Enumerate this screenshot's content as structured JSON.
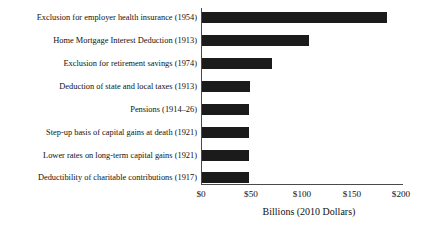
{
  "chart_data": {
    "type": "bar",
    "orientation": "horizontal",
    "title": "",
    "subtitle": "",
    "xlabel": "Billions (2010 Dollars)",
    "ylabel": "",
    "xlim": [
      0,
      200
    ],
    "xticks": [
      0,
      50,
      100,
      150,
      200
    ],
    "xtick_labels": [
      "$0",
      "$50",
      "$100",
      "$150",
      "$200"
    ],
    "grid": false,
    "legend": false,
    "bar_color": "#1b1b1b",
    "axis_color": "#4a4a4a",
    "categories": [
      "Exclusion for employer health insurance  (1954)",
      "Home Mortgage Interest Deduction (1913)",
      "Exclusion for retirement savings (1974)",
      "Deduction of state and local taxes (1913)",
      "Pensions (1914–26)",
      "Step-up basis of capital gains at death (1921)",
      "Lower rates on long-term capital gains (1921)",
      "Deductibility of charitable contributions  (1917)"
    ],
    "values": [
      184,
      106,
      70,
      48,
      47,
      47,
      47,
      47
    ]
  },
  "axis": {
    "x_title": "Billions (2010 Dollars)",
    "tick_0": "$0",
    "tick_1": "$50",
    "tick_2": "$100",
    "tick_3": "$150",
    "tick_4": "$200"
  },
  "rows": [
    {
      "label": "Exclusion for employer health insurance  (1954)",
      "value": 184
    },
    {
      "label": "Home Mortgage Interest Deduction (1913)",
      "value": 106
    },
    {
      "label": "Exclusion for retirement savings (1974)",
      "value": 70
    },
    {
      "label": "Deduction of state and local taxes (1913)",
      "value": 48
    },
    {
      "label": "Pensions (1914–26)",
      "value": 47
    },
    {
      "label": "Step-up basis of capital gains at death (1921)",
      "value": 47
    },
    {
      "label": "Lower rates on long-term capital gains (1921)",
      "value": 47
    },
    {
      "label": "Deductibility of charitable contributions  (1917)",
      "value": 47
    }
  ]
}
